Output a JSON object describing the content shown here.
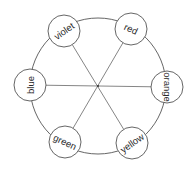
{
  "diagram": {
    "type": "color-wheel",
    "center": [
      98,
      86
    ],
    "ring_radius": 68,
    "node_radius": 16,
    "stroke_color": "#555555",
    "nodes": [
      {
        "label": "violet",
        "cx": 64,
        "cy": 31,
        "rotate": -35
      },
      {
        "label": "red",
        "cx": 131,
        "cy": 29,
        "rotate": 25
      },
      {
        "label": "orange",
        "cx": 167,
        "cy": 87,
        "rotate": 90
      },
      {
        "label": "yellow",
        "cx": 132,
        "cy": 143,
        "rotate": -35
      },
      {
        "label": "green",
        "cx": 65,
        "cy": 142,
        "rotate": 25
      },
      {
        "label": "blue",
        "cx": 30,
        "cy": 85,
        "rotate": -90
      }
    ],
    "connections": [
      [
        "blue",
        "orange"
      ],
      [
        "violet",
        "yellow"
      ],
      [
        "red",
        "green"
      ]
    ]
  }
}
